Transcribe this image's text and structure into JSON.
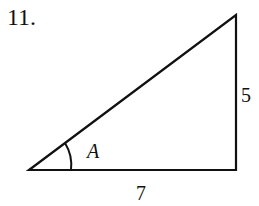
{
  "problem": {
    "number": "11."
  },
  "triangle": {
    "type": "right-triangle",
    "vertices": {
      "left": [
        29,
        170
      ],
      "top": [
        236,
        15
      ],
      "right_angle": [
        236,
        170
      ]
    },
    "sides": {
      "vertical": "5",
      "horizontal": "7"
    },
    "angle_label": "A",
    "stroke_color": "#111111"
  }
}
